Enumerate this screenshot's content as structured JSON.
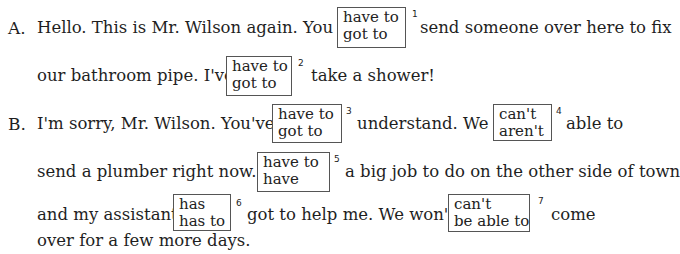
{
  "exercise": {
    "speakers": [
      {
        "label": "A.",
        "lines": [
          {
            "before": "Hello.   This is Mr. Wilson again.   You",
            "after": "send someone over here to fix"
          },
          {
            "before": "our bathroom pipe.   I've",
            "after": "take a shower!"
          }
        ]
      },
      {
        "label": "B.",
        "lines": [
          {
            "before": "I'm sorry, Mr. Wilson.   You've",
            "middle": "understand.   We",
            "after": "able to"
          },
          {
            "before": "send a plumber right now.   I",
            "after": "a big job to do on the other side of town"
          },
          {
            "before": "and my assistant",
            "middle": "got to help me.   We won't",
            "after": "come"
          },
          {
            "before": "over for a few more days."
          }
        ]
      }
    ],
    "choices": [
      {
        "number": "1",
        "options": [
          "have to",
          "got to"
        ]
      },
      {
        "number": "2",
        "options": [
          "have to",
          "got to"
        ]
      },
      {
        "number": "3",
        "options": [
          "have to",
          "got to"
        ]
      },
      {
        "number": "4",
        "options": [
          "can't",
          "aren't"
        ]
      },
      {
        "number": "5",
        "options": [
          "have to",
          "have"
        ]
      },
      {
        "number": "6",
        "options": [
          "has",
          "has to"
        ]
      },
      {
        "number": "7",
        "options": [
          "can't",
          "be able to"
        ]
      }
    ]
  }
}
